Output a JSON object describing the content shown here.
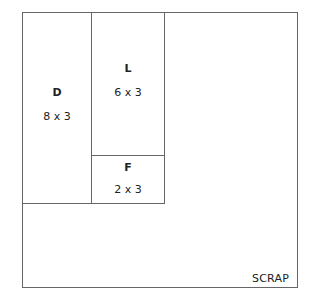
{
  "diagram": {
    "type": "cutting-layout",
    "pieces": [
      {
        "name": "D",
        "size": "8 x 3"
      },
      {
        "name": "L",
        "size": "6 x 3"
      },
      {
        "name": "F",
        "size": "2 x 3"
      }
    ],
    "scrap_label": "SCRAP"
  }
}
